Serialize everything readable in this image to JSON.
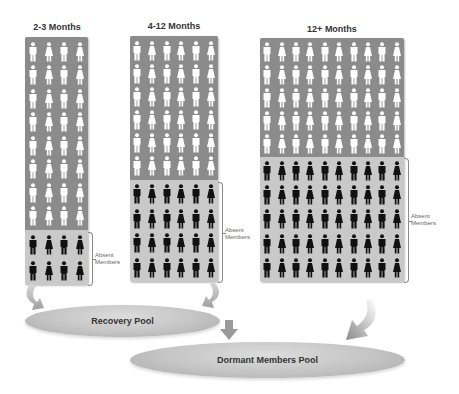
{
  "diagram": {
    "groups": [
      {
        "title": "2-3 Months",
        "columns": 4,
        "active_rows": 8,
        "absent_rows": 2,
        "absent_label": "Absent Members"
      },
      {
        "title": "4-12 Months",
        "columns": 6,
        "active_rows": 6,
        "absent_rows": 4,
        "absent_label": "Absent Members"
      },
      {
        "title": "12+ Months",
        "columns": 10,
        "active_rows": 5,
        "absent_rows": 5,
        "absent_label": "Absent Members"
      }
    ],
    "pools": [
      {
        "label": "Recovery Pool"
      },
      {
        "label": "Dormant Members Pool"
      }
    ],
    "colors": {
      "active_bg": "#8b8b8b",
      "absent_bg": "#c9c9c9",
      "active_figure": "#ffffff",
      "absent_figure": "#111111",
      "pool": "#c4c4c4"
    },
    "icons": {
      "figure_male": "person-male-icon",
      "figure_female": "person-female-icon"
    }
  }
}
